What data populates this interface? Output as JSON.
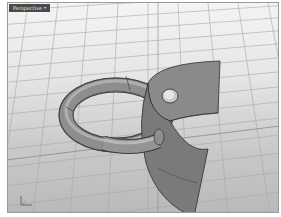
{
  "viewport": {
    "label": "Perspective",
    "dropdown_icon": "chevron-down-icon",
    "background_top": "#f4f4f4",
    "background_bottom": "#b9b9b9",
    "grid_color": "#a8a8a8",
    "border_color": "#9a9a9a"
  },
  "scene": {
    "objects": [
      {
        "name": "torus-ring",
        "color": "#8a8a8a"
      },
      {
        "name": "curved-plate-with-hole",
        "color": "#7e7e7e"
      }
    ]
  },
  "axes_widget": {
    "x_label": "x",
    "z_label": "z"
  }
}
